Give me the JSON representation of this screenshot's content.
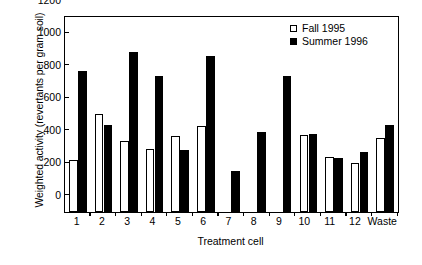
{
  "chart_data": {
    "type": "bar",
    "title": "",
    "xlabel": "Treatment cell",
    "ylabel": "Weighted activity (revertants per gram soil)",
    "categories": [
      "1",
      "2",
      "3",
      "4",
      "5",
      "6",
      "7",
      "8",
      "9",
      "10",
      "11",
      "12",
      "Waste"
    ],
    "series": [
      {
        "name": "Fall 1995",
        "style": "open",
        "values": [
          320,
          605,
          440,
          390,
          470,
          530,
          null,
          null,
          null,
          475,
          340,
          300,
          455
        ]
      },
      {
        "name": "Summer 1996",
        "style": "filled",
        "values": [
          870,
          535,
          985,
          840,
          380,
          960,
          255,
          495,
          840,
          480,
          330,
          370,
          535
        ]
      }
    ],
    "ylim": [
      0,
      1200
    ],
    "yticks": [
      0,
      200,
      400,
      600,
      800,
      1000,
      1200
    ],
    "ytick_labels": [
      "0",
      "200",
      "400",
      "600",
      "800",
      "1000",
      "1200"
    ],
    "grid": false,
    "legend_position": "top-right",
    "colors": {
      "fall_fill": "#ffffff",
      "summer_fill": "#000000",
      "axis": "#000000",
      "background": "#ffffff"
    }
  }
}
